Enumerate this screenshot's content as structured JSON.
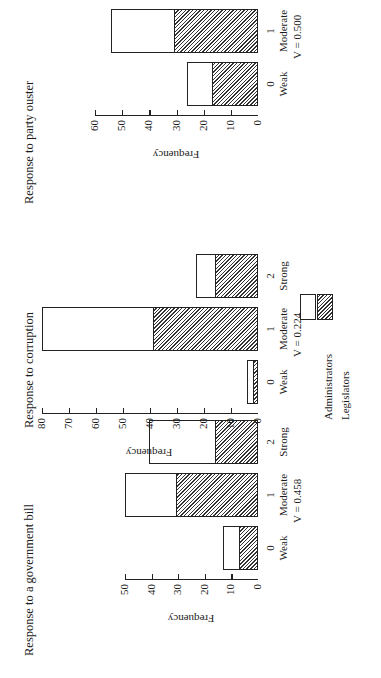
{
  "legend": {
    "items": [
      {
        "name": "Administrators",
        "pattern": "white"
      },
      {
        "name": "Legislators",
        "pattern": "hatched"
      }
    ]
  },
  "panels": [
    {
      "title": "Response to a government bill",
      "ylabel": "Frequency",
      "yticks": [
        "0",
        "10",
        "20",
        "30",
        "40",
        "50"
      ],
      "categories": [
        {
          "num": "0",
          "label": "Weak"
        },
        {
          "num": "1",
          "label": "Moderate"
        },
        {
          "num": "2",
          "label": "Strong"
        }
      ],
      "v_label": "V = 0.458"
    },
    {
      "title": "Response to corruption",
      "ylabel": "Frequency",
      "yticks": [
        "0",
        "10",
        "20",
        "30",
        "40",
        "50",
        "60",
        "70",
        "80"
      ],
      "categories": [
        {
          "num": "0",
          "label": "Weak"
        },
        {
          "num": "1",
          "label": "Moderate"
        },
        {
          "num": "2",
          "label": "Strong"
        }
      ],
      "v_label": "V = 0.224"
    },
    {
      "title": "Response to party ouster",
      "ylabel": "Frequency",
      "yticks": [
        "0",
        "10",
        "20",
        "30",
        "40",
        "50",
        "60"
      ],
      "categories": [
        {
          "num": "0",
          "label": "Weak"
        },
        {
          "num": "1",
          "label": "Moderate"
        },
        {
          "num": "2",
          "label": "Strong"
        }
      ],
      "v_label": "V = 0.500"
    }
  ],
  "chart_data": [
    {
      "type": "bar",
      "stacked": true,
      "orientation": "rotated -90deg on page",
      "title": "Response to a government bill",
      "xlabel": "",
      "ylabel": "Frequency",
      "categories": [
        "0 Weak",
        "1 Moderate",
        "2 Strong"
      ],
      "series": [
        {
          "name": "Legislators",
          "values": [
            7,
            31,
            16
          ]
        },
        {
          "name": "Administrators",
          "values": [
            6,
            19,
            25
          ]
        }
      ],
      "totals": [
        13,
        50,
        41
      ],
      "ylim": [
        0,
        50
      ],
      "annotation": "V = 0.458",
      "grid": false
    },
    {
      "type": "bar",
      "stacked": true,
      "orientation": "rotated -90deg on page",
      "title": "Response to corruption",
      "xlabel": "",
      "ylabel": "Frequency",
      "categories": [
        "0 Weak",
        "1 Moderate",
        "2 Strong"
      ],
      "series": [
        {
          "name": "Legislators",
          "values": [
            2,
            39,
            16
          ]
        },
        {
          "name": "Administrators",
          "values": [
            2,
            41,
            7
          ]
        }
      ],
      "totals": [
        4,
        80,
        23
      ],
      "ylim": [
        0,
        80
      ],
      "annotation": "V = 0.224",
      "grid": false
    },
    {
      "type": "bar",
      "stacked": true,
      "orientation": "rotated -90deg on page",
      "title": "Response to party ouster",
      "xlabel": "",
      "ylabel": "Frequency",
      "categories": [
        "0 Weak",
        "1 Moderate",
        "2 Strong"
      ],
      "series": [
        {
          "name": "Legislators",
          "values": [
            17,
            31,
            11
          ]
        },
        {
          "name": "Administrators",
          "values": [
            9,
            23,
            17
          ]
        }
      ],
      "totals": [
        26,
        54,
        28
      ],
      "ylim": [
        0,
        60
      ],
      "annotation": "V = 0.500",
      "grid": false
    }
  ]
}
